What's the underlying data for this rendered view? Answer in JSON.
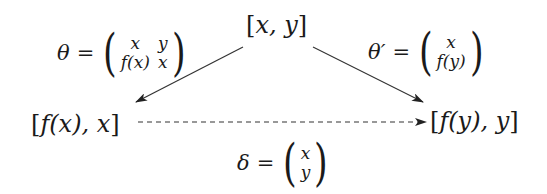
{
  "diagram": {
    "nodes": {
      "top": {
        "open": "[",
        "content": "x, y",
        "close": "]"
      },
      "left": {
        "open": "[",
        "content": "f(x), x",
        "close": "]"
      },
      "right": {
        "open": "[",
        "content": "f(y), y",
        "close": "]"
      }
    },
    "edges": {
      "theta": {
        "symbol": "θ",
        "equals": "=",
        "matrix": [
          [
            "x",
            "y"
          ],
          [
            "f(x)",
            "x"
          ]
        ],
        "from": "top",
        "to": "left",
        "style": "solid"
      },
      "theta_prime": {
        "symbol": "θ′",
        "equals": "=",
        "matrix": [
          [
            "x"
          ],
          [
            "f(y)"
          ]
        ],
        "from": "top",
        "to": "right",
        "style": "solid"
      },
      "delta": {
        "symbol": "δ",
        "equals": "=",
        "matrix": [
          [
            "x"
          ],
          [
            "y"
          ]
        ],
        "from": "left",
        "to": "right",
        "style": "dashed"
      }
    },
    "parens": {
      "open": "(",
      "close": ")"
    },
    "colors": {
      "ink": "#1a1a1a",
      "arrow": "#333333",
      "background": "#ffffff"
    }
  }
}
